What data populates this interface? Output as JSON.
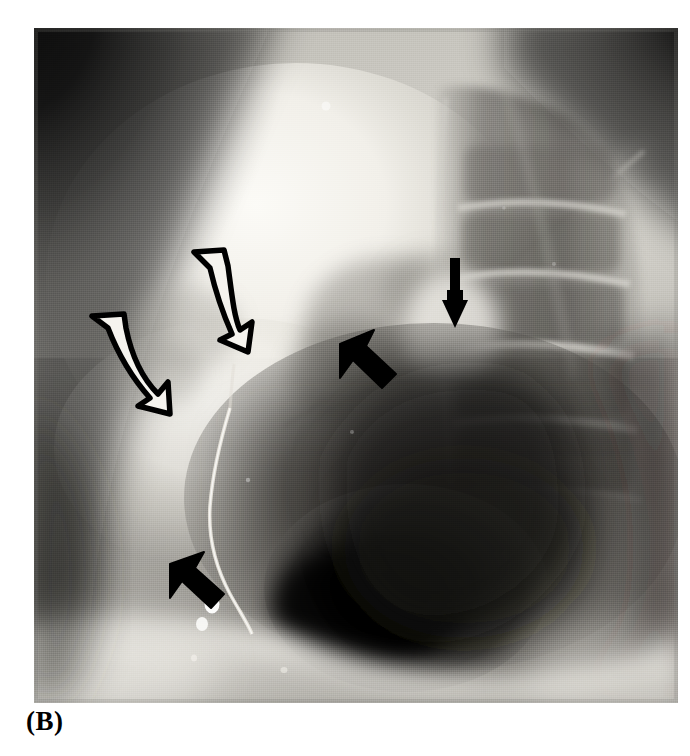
{
  "figure": {
    "caption": "(B)",
    "modality": "radiograph",
    "view": "lateral chest",
    "plate": {
      "x": 34,
      "y": 28,
      "width": 644,
      "height": 675,
      "background_color": "#9a9a9a",
      "border_color": "#ffffff"
    }
  },
  "palette": {
    "page_background": "#ffffff",
    "caption_color": "#000000",
    "annotation_outline": "#000000",
    "annotation_fill_open": "#f2f0ea",
    "annotation_fill_solid": "#000000",
    "film_dark": "#0d0d0d",
    "film_mid": "#6e6e6e",
    "film_light": "#e8e6e0",
    "film_bright": "#fbfaf6"
  },
  "radiograph_regions": [
    {
      "name": "upper-left-soft-tissue-shadow",
      "tone": "very-dark",
      "note": "dense scapula / shoulder soft tissue, top-left corner"
    },
    {
      "name": "upper-right-soft-tissue-shadow",
      "tone": "very-dark",
      "note": "dense shoulder girdle, top-right corner"
    },
    {
      "name": "retrosternal-lucency",
      "tone": "bright",
      "note": "large lucent anterior lung field, left of center"
    },
    {
      "name": "thoracic-spine",
      "tone": "mid-dark",
      "note": "stacked vertebral bodies with horizontal disc spaces, right of center"
    },
    {
      "name": "cardiac-mediastinal-density",
      "tone": "very-dark",
      "note": "dense heart / mediastinal mass, lower centre"
    },
    {
      "name": "diaphragm-and-subphrenic",
      "tone": "light",
      "note": "curved bright band across the lower third"
    },
    {
      "name": "posterior-costophrenic-recess",
      "tone": "mid",
      "note": "lower right of the plate"
    }
  ],
  "annotations": [
    {
      "id": "open-arrow-1",
      "type": "open-curved-arrow",
      "style": "hollow outlined",
      "direction": "down-right",
      "points_to": "anterior mediastinal / retrosternal abnormality",
      "x": 188,
      "y": 252,
      "width": 48,
      "height": 84
    },
    {
      "id": "open-arrow-2",
      "type": "open-curved-arrow",
      "style": "hollow outlined",
      "direction": "down-right",
      "points_to": "anterior mediastinal / retrosternal abnormality",
      "x": 88,
      "y": 312,
      "width": 96,
      "height": 84
    },
    {
      "id": "solid-arrow-thin",
      "type": "solid-straight-arrow",
      "style": "filled narrow shaft",
      "direction": "down",
      "points_to": "para-vertebral / posterior structure",
      "x": 446,
      "y": 258,
      "width": 22,
      "height": 64
    },
    {
      "id": "solid-arrow-upper",
      "type": "solid-block-arrow",
      "style": "filled thick",
      "direction": "up-left",
      "points_to": "posterior mediastinal margin",
      "x": 340,
      "y": 330,
      "width": 56,
      "height": 56
    },
    {
      "id": "solid-arrow-lower",
      "type": "solid-block-arrow",
      "style": "filled thick",
      "direction": "up-left",
      "points_to": "catheter / device related finding",
      "x": 170,
      "y": 552,
      "width": 56,
      "height": 52
    }
  ],
  "devices": [
    {
      "id": "catheter-line",
      "name": "radiopaque catheter",
      "note": "thin bright curvilinear line descending through the mid field"
    },
    {
      "id": "radiopaque-marker-1",
      "name": "radiopaque marker",
      "x": 212,
      "y": 604,
      "rx": 7,
      "ry": 9
    },
    {
      "id": "radiopaque-marker-2",
      "name": "radiopaque marker",
      "x": 202,
      "y": 623,
      "rx": 6,
      "ry": 7
    }
  ]
}
